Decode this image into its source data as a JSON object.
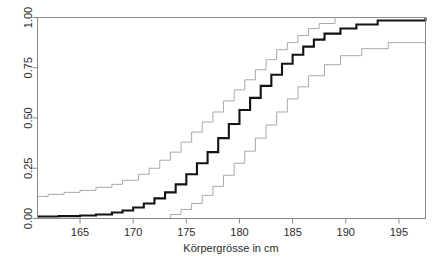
{
  "chart_data": {
    "type": "line",
    "subtype": "step-ecdf-with-confidence-band",
    "title": "",
    "subtitle": "",
    "xlabel": "Körpergrösse in cm",
    "ylabel": "",
    "xlim": [
      161.0,
      197.5
    ],
    "ylim": [
      0.0,
      1.0
    ],
    "xticks": [
      165,
      170,
      175,
      180,
      185,
      190,
      195
    ],
    "xtick_labels": [
      "165",
      "170",
      "175",
      "180",
      "185",
      "190",
      "195"
    ],
    "yticks": [
      0.0,
      0.25,
      0.5,
      0.75,
      1.0
    ],
    "ytick_labels": [
      "0.00",
      "0.25",
      "0.50",
      "0.75",
      "1.00"
    ],
    "grid": false,
    "legend": null,
    "legend_position": "none",
    "box": true,
    "colors": {
      "estimate": "#131313",
      "confidence_band": "#a9a9a9",
      "axis": "#8a8a8a",
      "background": "#ffffff"
    },
    "series": [
      {
        "name": "Upper confidence bound",
        "style": "step",
        "color": "#a9a9a9",
        "width": 1,
        "x": [
          161.0,
          162.0,
          163.5,
          165.0,
          166.5,
          168.0,
          169.0,
          170.5,
          171.5,
          172.5,
          173.5,
          174.5,
          175.5,
          176.5,
          177.5,
          178.5,
          179.5,
          180.5,
          181.5,
          182.5,
          183.5,
          184.5,
          185.5,
          186.5,
          187.5,
          189.0,
          197.5
        ],
        "y": [
          0.11,
          0.12,
          0.13,
          0.14,
          0.155,
          0.17,
          0.19,
          0.22,
          0.25,
          0.29,
          0.33,
          0.38,
          0.43,
          0.48,
          0.53,
          0.585,
          0.64,
          0.69,
          0.74,
          0.79,
          0.84,
          0.875,
          0.91,
          0.945,
          0.97,
          1.0,
          1.0
        ]
      },
      {
        "name": "ECDF estimate",
        "style": "step",
        "color": "#131313",
        "width": 2,
        "x": [
          161.0,
          163.0,
          165.0,
          166.5,
          168.0,
          169.0,
          170.0,
          171.0,
          172.0,
          173.0,
          174.0,
          175.0,
          176.0,
          177.0,
          178.0,
          179.0,
          180.0,
          181.0,
          182.0,
          183.0,
          184.0,
          185.0,
          186.0,
          187.0,
          188.0,
          189.5,
          191.0,
          193.0,
          197.5
        ],
        "y": [
          0.01,
          0.012,
          0.015,
          0.02,
          0.03,
          0.04,
          0.055,
          0.075,
          0.1,
          0.13,
          0.17,
          0.22,
          0.275,
          0.33,
          0.4,
          0.47,
          0.54,
          0.6,
          0.66,
          0.715,
          0.77,
          0.815,
          0.855,
          0.89,
          0.92,
          0.945,
          0.965,
          0.985,
          1.0
        ]
      },
      {
        "name": "Lower confidence bound",
        "style": "step",
        "color": "#a9a9a9",
        "width": 1,
        "x": [
          161.0,
          172.5,
          173.5,
          174.5,
          175.5,
          176.5,
          177.5,
          178.5,
          179.5,
          180.5,
          181.5,
          182.5,
          183.5,
          184.5,
          185.5,
          186.5,
          188.0,
          189.5,
          191.5,
          194.0,
          197.5
        ],
        "y": [
          0.0,
          0.0,
          0.02,
          0.045,
          0.075,
          0.115,
          0.16,
          0.215,
          0.275,
          0.335,
          0.4,
          0.465,
          0.53,
          0.595,
          0.655,
          0.71,
          0.765,
          0.81,
          0.845,
          0.875,
          0.875
        ]
      }
    ]
  },
  "axis": {
    "x_title": "Körpergrösse in cm"
  }
}
